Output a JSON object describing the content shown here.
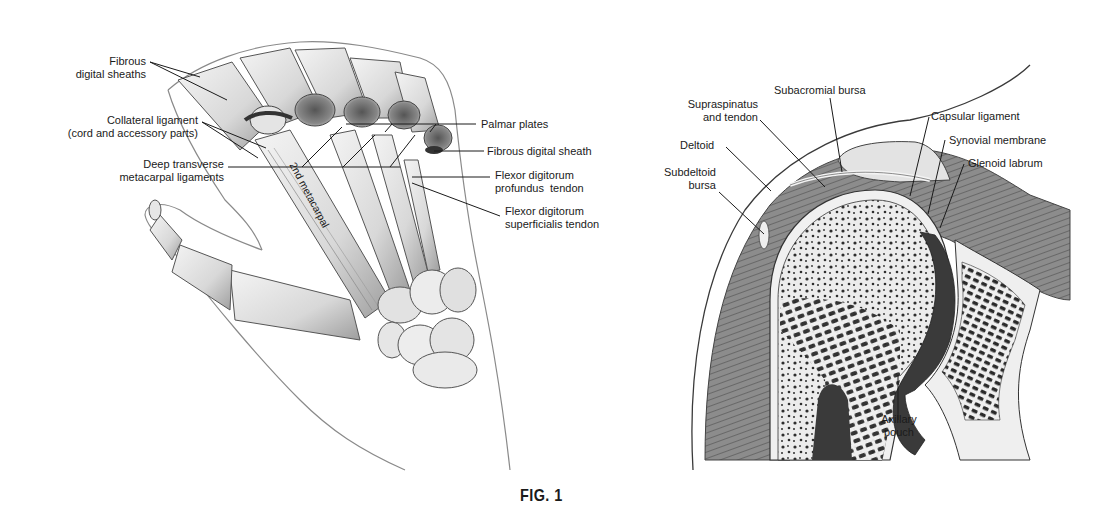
{
  "figure": {
    "caption": "FIG. 1",
    "panels": [
      {
        "id": "hand",
        "title": "Hand — palmar structures of the fingers",
        "labels": [
          {
            "lines": [
              "Fibrous",
              "digital sheaths"
            ]
          },
          {
            "lines": [
              "Collateral ligament",
              "(cord and accessory parts)"
            ]
          },
          {
            "lines": [
              "Deep transverse",
              "metacarpal ligaments"
            ]
          },
          {
            "lines": [
              "Palmar plates"
            ]
          },
          {
            "lines": [
              "Fibrous digital sheath"
            ]
          },
          {
            "lines": [
              "Flexor digitorum",
              "profundus  tendon"
            ]
          },
          {
            "lines": [
              "Flexor digitorum",
              "superficialis tendon"
            ]
          }
        ],
        "bone_label": "2nd metacarpal"
      },
      {
        "id": "shoulder",
        "title": "Shoulder joint — coronal section",
        "labels": [
          {
            "lines": [
              "Subacromial bursa"
            ]
          },
          {
            "lines": [
              "Supraspinatus",
              "and tendon"
            ]
          },
          {
            "lines": [
              "Deltoid"
            ]
          },
          {
            "lines": [
              "Subdeltoid",
              "bursa"
            ]
          },
          {
            "lines": [
              "Capsular ligament"
            ]
          },
          {
            "lines": [
              "Synovial membrane"
            ]
          },
          {
            "lines": [
              "Glenoid labrum"
            ]
          },
          {
            "lines": [
              "Axillary",
              "pouch"
            ]
          }
        ]
      }
    ]
  },
  "colors": {
    "background": "#ffffff",
    "ink": "#1a1a1a",
    "bone_fill": "#e6e6e6",
    "bone_shade": "#9a9a9a",
    "muscle": "#7d7d7d",
    "cavity": "#3a3a3a"
  }
}
